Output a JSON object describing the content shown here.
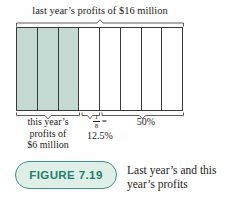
{
  "figure": {
    "top_label": "last year’s profits of $16 million",
    "bar": {
      "total_segments": 8,
      "shaded_segments": 3
    },
    "annotations": {
      "shaded_label_lines": [
        "this year’s",
        "profits of",
        "$6 million"
      ],
      "one_eighth": {
        "numerator": "1",
        "denominator": "8",
        "equals": "=",
        "percent": "12.5%"
      },
      "half_label": "50%"
    },
    "caption": {
      "tag": "FIGURE 7.19",
      "text": "Last year’s and this year’s profits"
    },
    "colors": {
      "shaded": "#c3d9d2",
      "line": "#3a3a3a",
      "pill_bg": "#dfeee7",
      "pill_border": "#3d9484",
      "pill_text": "#1e8070",
      "text": "#1f1d1b"
    }
  },
  "chart_data": {
    "type": "bar",
    "categories": [
      "last year’s profits",
      "this year’s profits"
    ],
    "values": [
      16,
      6
    ],
    "unit": "millions of dollars",
    "title": "Last year’s and this year’s profits",
    "segments": {
      "total": 8,
      "shaded": 3,
      "value_per_segment": 2,
      "one_segment_fraction": "1/8",
      "one_segment_percent": 12.5,
      "right_bracket_percent": 50
    },
    "legend_position": "none",
    "grid": false
  }
}
